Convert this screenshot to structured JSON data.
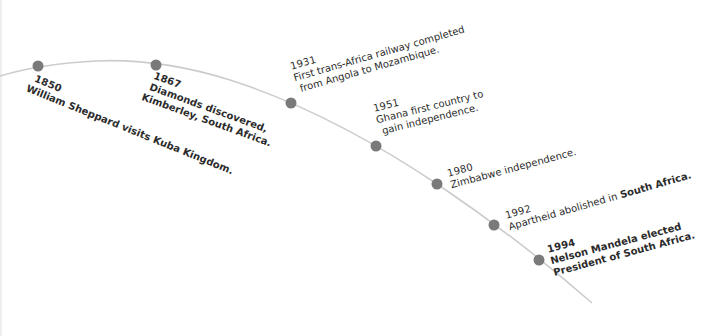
{
  "timeline": {
    "line_color": "#cccccc",
    "dot_color": "#7a7a7a",
    "text_color": "#2b2b2b",
    "events": [
      {
        "year": "1850",
        "lines": [
          "William Sheppard visits Kuba Kingdom."
        ],
        "dot": {
          "x": 38,
          "y": 66
        }
      },
      {
        "year": "1867",
        "lines": [
          "Diamonds discovered,",
          "Kimberley, South Africa."
        ],
        "dot": {
          "x": 156,
          "y": 65
        }
      },
      {
        "year": "1931",
        "lines": [
          "First trans-Africa railway completed",
          "from Angola to Mozambique."
        ],
        "dot": {
          "x": 291,
          "y": 103
        }
      },
      {
        "year": "1951",
        "lines": [
          "Ghana first country to",
          "gain independence."
        ],
        "dot": {
          "x": 376,
          "y": 146
        }
      },
      {
        "year": "1980",
        "lines": [
          "Zimbabwe independence."
        ],
        "dot": {
          "x": 437,
          "y": 184
        }
      },
      {
        "year": "1992",
        "lines": [
          "Apartheid abolished in",
          "South Africa."
        ],
        "dot": {
          "x": 494,
          "y": 225
        }
      },
      {
        "year": "1994",
        "lines": [
          "Nelson Mandela elected",
          "President of South Africa."
        ],
        "dot": {
          "x": 539,
          "y": 260
        }
      }
    ]
  }
}
